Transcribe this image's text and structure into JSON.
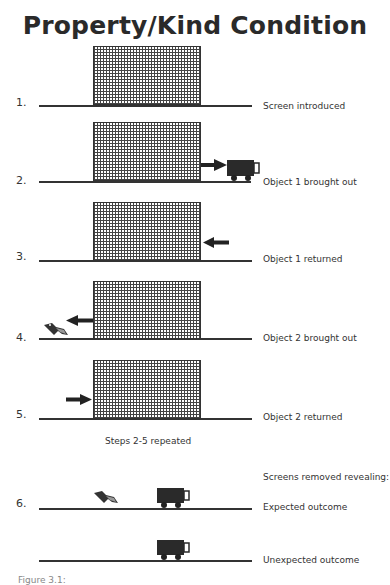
{
  "title": "Property/Kind Condition",
  "steps": [
    {
      "number": "1.",
      "label": "Screen introduced"
    },
    {
      "number": "2.",
      "label": "Object 1 brought out"
    },
    {
      "number": "3.",
      "label": "Object 1 returned"
    },
    {
      "number": "4.",
      "label": "Object 2 brought out"
    },
    {
      "number": "5.",
      "label": "Object 2 returned"
    },
    {
      "number": "6.",
      "label": "Expected outcome"
    }
  ],
  "repeat_note": "Steps 2-5 repeated",
  "reveal_note": "Screens removed revealing:",
  "unexpected_label": "Unexpected outcome",
  "objects": {
    "object_1": "truck-icon",
    "object_2": "bird-icon"
  },
  "caption": "Figure 3.1:"
}
